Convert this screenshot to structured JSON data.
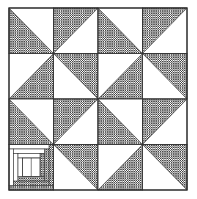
{
  "quilt": {
    "rows": 4,
    "cols": 4,
    "origin": [
      9,
      8
    ],
    "cell_w": 44.5,
    "cell_h": 45.5,
    "colors": {
      "hatch": "#3a3a3a",
      "background": "#ffffff",
      "line": "#333333"
    },
    "cells": [
      [
        "lower-left",
        "upper-left",
        "lower-left",
        "upper-left"
      ],
      [
        "lower-right",
        "upper-right",
        "lower-right",
        "upper-right"
      ],
      [
        "lower-left",
        "upper-left",
        "lower-left",
        "upper-left"
      ],
      [
        "log-cabin",
        "upper-right",
        "lower-right",
        "upper-right"
      ]
    ]
  }
}
